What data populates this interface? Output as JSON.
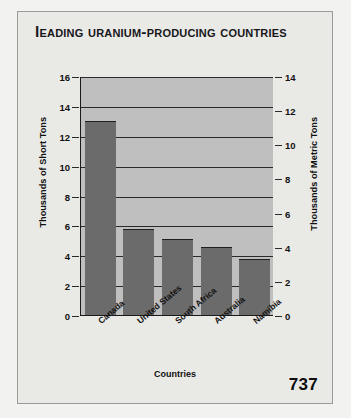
{
  "page_number": "737",
  "chart_data": {
    "type": "bar",
    "title": "Leading Uranium-Producing Countries",
    "xlabel": "Countries",
    "ylabel": "Thousands of Short Tons",
    "ylabel_secondary": "Thousands of Metric Tons",
    "categories": [
      "Canada",
      "United States",
      "South Africa",
      "Australia",
      "Namibia"
    ],
    "values": [
      12.9,
      5.7,
      5.0,
      4.5,
      3.7
    ],
    "ylim": [
      0,
      16
    ],
    "yticks": [
      0,
      2,
      4,
      6,
      8,
      10,
      12,
      14,
      16
    ],
    "ylim_secondary": [
      0,
      14
    ],
    "yticks_secondary": [
      0,
      2,
      4,
      6,
      8,
      10,
      12,
      14
    ],
    "grid": true,
    "legend": "none",
    "bar_color": "#6b6b6b",
    "plot_background": "#bfbfbf"
  }
}
